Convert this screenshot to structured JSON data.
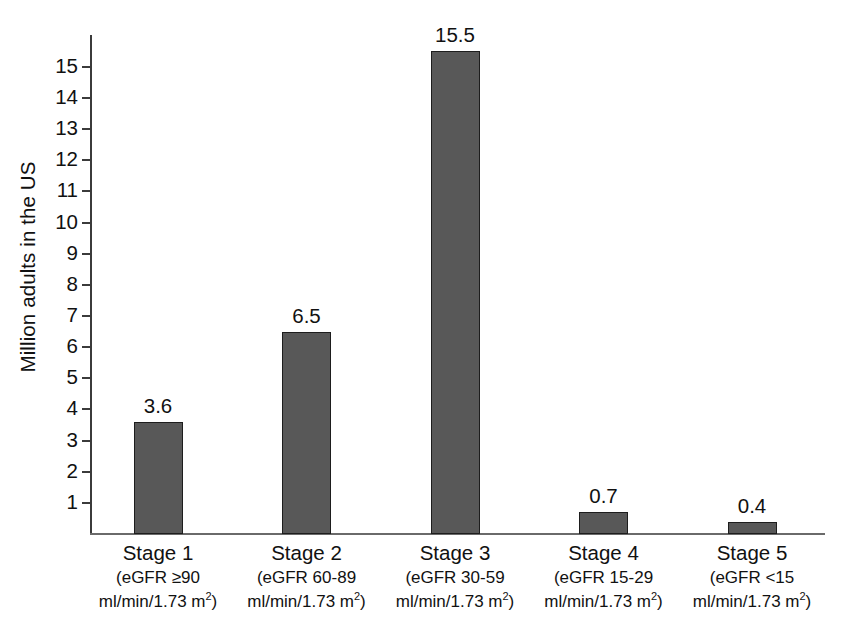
{
  "chart_data": {
    "type": "bar",
    "title": "",
    "xlabel": "",
    "ylabel": "Million adults in the US",
    "categories": [
      "Stage 1",
      "Stage 2",
      "Stage 3",
      "Stage 4",
      "Stage 5"
    ],
    "category_sublabels": [
      [
        "(eGFR ≥90",
        "ml/min/1.73 m",
        "2",
        ")"
      ],
      [
        "(eGFR 60-89",
        "ml/min/1.73 m",
        "2",
        ")"
      ],
      [
        "(eGFR 30-59",
        "ml/min/1.73 m",
        "2",
        ")"
      ],
      [
        "(eGFR 15-29",
        "ml/min/1.73 m",
        "2",
        ")"
      ],
      [
        "(eGFR <15",
        "ml/min/1.73 m",
        "2",
        ")"
      ]
    ],
    "values": [
      3.6,
      6.5,
      15.5,
      0.7,
      0.4
    ],
    "value_labels": [
      "3.6",
      "6.5",
      "15.5",
      "0.7",
      "0.4"
    ],
    "ylim": [
      0,
      16
    ],
    "yticks": [
      15,
      14,
      13,
      12,
      11,
      10,
      9,
      8,
      7,
      6,
      5,
      4,
      3,
      2,
      1
    ],
    "ytick_labels": [
      "15",
      "14",
      "13",
      "12",
      "11",
      "10",
      "9",
      "8",
      "7",
      "6",
      "5",
      "4",
      "3",
      "2",
      "1"
    ],
    "grid": false,
    "legend": null,
    "bar_color": "#585858",
    "bar_edge_color": "#1d1d1d",
    "axis_color": "#3b3b3b",
    "text_color": "#111111",
    "background_color": "#ffffff"
  },
  "axis": {
    "y_title": "Million adults in the US"
  }
}
